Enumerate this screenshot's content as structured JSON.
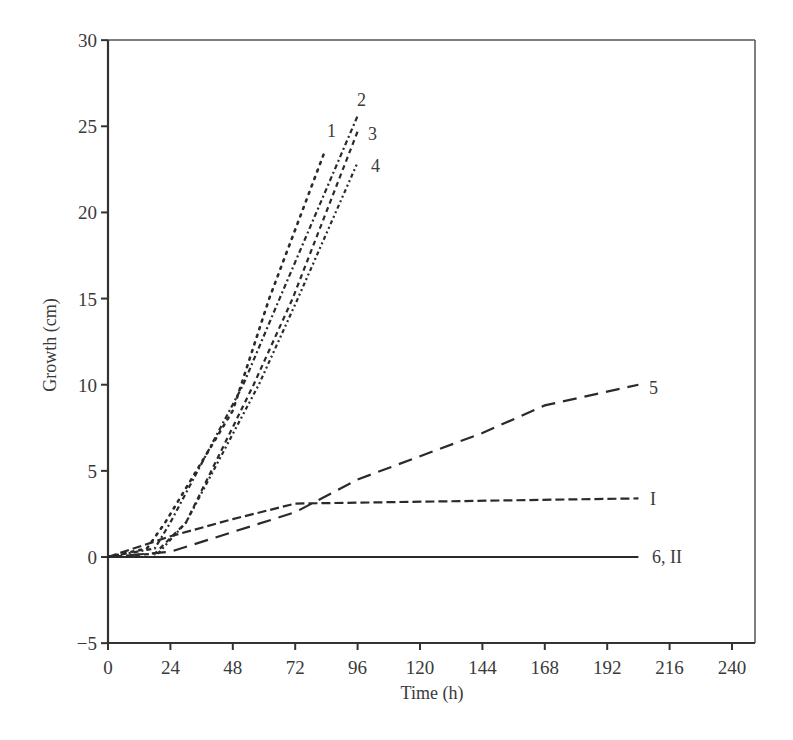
{
  "chart_data": {
    "type": "line",
    "title": "",
    "xlabel": "Time (h)",
    "ylabel": "Growth (cm)",
    "xlim": [
      0,
      250
    ],
    "ylim": [
      -5,
      30
    ],
    "xticks": [
      0,
      24,
      48,
      72,
      96,
      120,
      144,
      168,
      192,
      216,
      240
    ],
    "yticks": [
      -5,
      0,
      5,
      10,
      15,
      20,
      25,
      30
    ],
    "grid": false,
    "legend": "inline labels at line ends",
    "series": [
      {
        "name": "1",
        "style": "dotted",
        "x": [
          0,
          15,
          22,
          48,
          62,
          83
        ],
        "y": [
          0,
          0.5,
          2,
          8.5,
          15,
          23.4
        ]
      },
      {
        "name": "2",
        "style": "dash-dot",
        "x": [
          0,
          18,
          24,
          52,
          66,
          96
        ],
        "y": [
          0,
          0.5,
          2,
          10,
          15,
          25.6
        ]
      },
      {
        "name": "3",
        "style": "short-dash",
        "x": [
          0,
          18,
          30,
          56,
          71,
          96
        ],
        "y": [
          0,
          0.2,
          2,
          10,
          15,
          24.7
        ]
      },
      {
        "name": "4",
        "style": "dash-dot-dot",
        "x": [
          0,
          18,
          30,
          58,
          73,
          96
        ],
        "y": [
          0,
          0,
          2,
          10,
          15,
          22.9
        ]
      },
      {
        "name": "5",
        "style": "long-dash",
        "x": [
          0,
          24,
          72,
          96,
          144,
          168,
          204
        ],
        "y": [
          0,
          0.3,
          2.6,
          4.5,
          7.2,
          8.8,
          10
        ]
      },
      {
        "name": "I",
        "style": "medium-dash",
        "x": [
          0,
          24,
          48,
          72,
          204
        ],
        "y": [
          0,
          1.2,
          2.2,
          3.1,
          3.4
        ]
      },
      {
        "name": "6, II",
        "style": "solid",
        "x": [
          0,
          204
        ],
        "y": [
          0,
          0
        ]
      }
    ]
  },
  "axes": {
    "xlabel": "Time (h)",
    "ylabel": "Growth (cm)"
  }
}
